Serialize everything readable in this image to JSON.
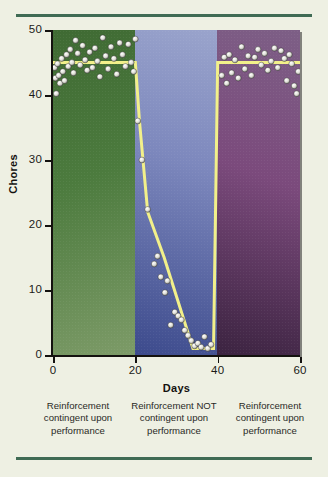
{
  "figure": {
    "background_color": "#eef0e3",
    "rule_color": "#3f6b54",
    "trendline_color": "#f2f08a",
    "point_color": "#e8e8e0"
  },
  "chart_data": {
    "type": "scatter",
    "title": "",
    "xlabel": "Days",
    "ylabel": "Chores",
    "xlim": [
      0,
      60
    ],
    "ylim": [
      0,
      50
    ],
    "xticks": [
      0,
      20,
      40,
      60
    ],
    "yticks": [
      0,
      10,
      20,
      30,
      40,
      50
    ],
    "grid": false,
    "legend": "none",
    "phases": [
      {
        "name": "baseline-reinforcement",
        "x_start": 0,
        "x_end": 20,
        "color": "#4c7b3e",
        "caption": "Reinforcement contingent upon performance",
        "trend_level": 45
      },
      {
        "name": "extinction",
        "x_start": 20,
        "x_end": 40,
        "color": "#5a66a8",
        "caption": "Reinforcement NOT contingent upon performance",
        "trend_level": null
      },
      {
        "name": "reinstatement",
        "x_start": 40,
        "x_end": 60,
        "color": "#7b4a7c",
        "caption": "Reinforcement contingent upon performance",
        "trend_level": 45
      }
    ],
    "trendline": [
      {
        "x": 0,
        "y": 45
      },
      {
        "x": 20,
        "y": 45
      },
      {
        "x": 21,
        "y": 36
      },
      {
        "x": 23,
        "y": 22
      },
      {
        "x": 27,
        "y": 15
      },
      {
        "x": 34,
        "y": 1
      },
      {
        "x": 39,
        "y": 1
      },
      {
        "x": 40,
        "y": 45
      },
      {
        "x": 60,
        "y": 45
      }
    ],
    "points": [
      {
        "x": 0.4,
        "y": 44.2
      },
      {
        "x": 0.6,
        "y": 42.6
      },
      {
        "x": 0.8,
        "y": 40.2
      },
      {
        "x": 1.1,
        "y": 44.8
      },
      {
        "x": 1.4,
        "y": 43.0
      },
      {
        "x": 1.7,
        "y": 41.8
      },
      {
        "x": 2.1,
        "y": 45.6
      },
      {
        "x": 2.4,
        "y": 43.6
      },
      {
        "x": 2.8,
        "y": 42.2
      },
      {
        "x": 3.3,
        "y": 46.2
      },
      {
        "x": 3.7,
        "y": 44.4
      },
      {
        "x": 4.2,
        "y": 47.0
      },
      {
        "x": 4.6,
        "y": 45.0
      },
      {
        "x": 5.0,
        "y": 43.4
      },
      {
        "x": 5.5,
        "y": 48.4
      },
      {
        "x": 6.0,
        "y": 46.4
      },
      {
        "x": 6.6,
        "y": 44.6
      },
      {
        "x": 7.2,
        "y": 47.6
      },
      {
        "x": 7.8,
        "y": 45.4
      },
      {
        "x": 8.3,
        "y": 43.8
      },
      {
        "x": 8.9,
        "y": 46.6
      },
      {
        "x": 9.6,
        "y": 44.2
      },
      {
        "x": 10.2,
        "y": 47.2
      },
      {
        "x": 10.8,
        "y": 45.2
      },
      {
        "x": 11.4,
        "y": 42.8
      },
      {
        "x": 12.1,
        "y": 48.8
      },
      {
        "x": 12.8,
        "y": 46.0
      },
      {
        "x": 13.4,
        "y": 44.0
      },
      {
        "x": 14.1,
        "y": 47.4
      },
      {
        "x": 14.8,
        "y": 45.6
      },
      {
        "x": 15.5,
        "y": 43.2
      },
      {
        "x": 16.2,
        "y": 48.0
      },
      {
        "x": 16.9,
        "y": 46.2
      },
      {
        "x": 17.6,
        "y": 44.4
      },
      {
        "x": 18.3,
        "y": 47.8
      },
      {
        "x": 19.0,
        "y": 45.0
      },
      {
        "x": 19.6,
        "y": 43.6
      },
      {
        "x": 20.0,
        "y": 48.6
      },
      {
        "x": 20.6,
        "y": 36.0
      },
      {
        "x": 21.6,
        "y": 30.0
      },
      {
        "x": 23.0,
        "y": 22.4
      },
      {
        "x": 24.6,
        "y": 14.0
      },
      {
        "x": 25.4,
        "y": 15.2
      },
      {
        "x": 26.2,
        "y": 12.0
      },
      {
        "x": 27.2,
        "y": 9.6
      },
      {
        "x": 27.8,
        "y": 11.4
      },
      {
        "x": 28.6,
        "y": 4.6
      },
      {
        "x": 29.6,
        "y": 6.6
      },
      {
        "x": 30.4,
        "y": 6.0
      },
      {
        "x": 31.2,
        "y": 5.4
      },
      {
        "x": 32.0,
        "y": 3.8
      },
      {
        "x": 32.8,
        "y": 3.0
      },
      {
        "x": 33.6,
        "y": 2.2
      },
      {
        "x": 34.4,
        "y": 1.4
      },
      {
        "x": 35.2,
        "y": 1.8
      },
      {
        "x": 36.0,
        "y": 1.2
      },
      {
        "x": 36.8,
        "y": 2.8
      },
      {
        "x": 37.6,
        "y": 1.0
      },
      {
        "x": 38.4,
        "y": 1.6
      },
      {
        "x": 41.0,
        "y": 43.0
      },
      {
        "x": 41.6,
        "y": 45.8
      },
      {
        "x": 42.2,
        "y": 41.8
      },
      {
        "x": 42.8,
        "y": 46.2
      },
      {
        "x": 43.4,
        "y": 43.4
      },
      {
        "x": 44.2,
        "y": 45.4
      },
      {
        "x": 45.0,
        "y": 42.6
      },
      {
        "x": 45.8,
        "y": 47.4
      },
      {
        "x": 46.6,
        "y": 44.0
      },
      {
        "x": 47.4,
        "y": 46.0
      },
      {
        "x": 48.2,
        "y": 43.0
      },
      {
        "x": 49.0,
        "y": 45.8
      },
      {
        "x": 49.8,
        "y": 47.0
      },
      {
        "x": 50.6,
        "y": 44.6
      },
      {
        "x": 51.4,
        "y": 46.4
      },
      {
        "x": 52.2,
        "y": 43.8
      },
      {
        "x": 53.0,
        "y": 45.2
      },
      {
        "x": 53.8,
        "y": 47.2
      },
      {
        "x": 54.6,
        "y": 44.2
      },
      {
        "x": 55.4,
        "y": 46.8
      },
      {
        "x": 56.2,
        "y": 45.6
      },
      {
        "x": 56.8,
        "y": 42.2
      },
      {
        "x": 57.4,
        "y": 46.2
      },
      {
        "x": 58.0,
        "y": 44.8
      },
      {
        "x": 58.6,
        "y": 41.4
      },
      {
        "x": 59.2,
        "y": 40.2
      },
      {
        "x": 59.6,
        "y": 43.6
      }
    ]
  }
}
